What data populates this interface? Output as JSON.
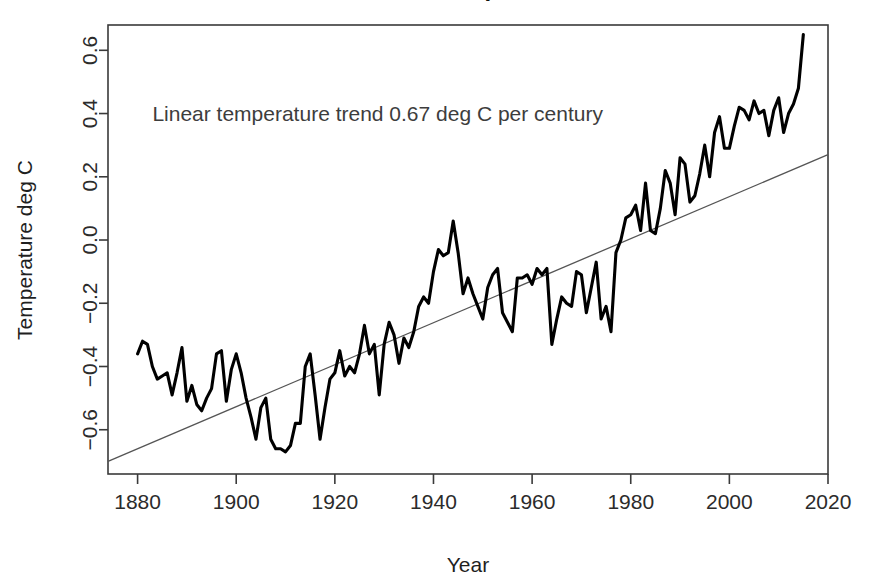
{
  "chart_data": {
    "type": "line",
    "title": "Global Land and Ocean Temperature Anomalies",
    "title_clipped": true,
    "xlabel": "Year",
    "ylabel": "Temperature deg C",
    "xlim": [
      1874,
      2020
    ],
    "ylim": [
      -0.74,
      0.68
    ],
    "grid": false,
    "legend": false,
    "xticks": [
      1880,
      1900,
      1920,
      1940,
      1960,
      1980,
      2000,
      2020
    ],
    "xtick_labels": [
      "1880",
      "1900",
      "1920",
      "1940",
      "1960",
      "1980",
      "2000",
      "2020"
    ],
    "yticks": [
      -0.6,
      -0.4,
      -0.2,
      0.0,
      0.2,
      0.4,
      0.6
    ],
    "ytick_labels": [
      "-0.6",
      "-0.4",
      "-0.2",
      "0.0",
      "0.2",
      "0.4",
      "0.6"
    ],
    "annotations": [
      {
        "text": "Linear temperature trend 0.67 deg C per century",
        "x": 1883,
        "y": 0.4
      }
    ],
    "series": [
      {
        "name": "Temperature anomaly",
        "color": "#000000",
        "x": [
          1880,
          1881,
          1882,
          1883,
          1884,
          1885,
          1886,
          1887,
          1888,
          1889,
          1890,
          1891,
          1892,
          1893,
          1894,
          1895,
          1896,
          1897,
          1898,
          1899,
          1900,
          1901,
          1902,
          1903,
          1904,
          1905,
          1906,
          1907,
          1908,
          1909,
          1910,
          1911,
          1912,
          1913,
          1914,
          1915,
          1916,
          1917,
          1918,
          1919,
          1920,
          1921,
          1922,
          1923,
          1924,
          1925,
          1926,
          1927,
          1928,
          1929,
          1930,
          1931,
          1932,
          1933,
          1934,
          1935,
          1936,
          1937,
          1938,
          1939,
          1940,
          1941,
          1942,
          1943,
          1944,
          1945,
          1946,
          1947,
          1948,
          1949,
          1950,
          1951,
          1952,
          1953,
          1954,
          1955,
          1956,
          1957,
          1958,
          1959,
          1960,
          1961,
          1962,
          1963,
          1964,
          1965,
          1966,
          1967,
          1968,
          1969,
          1970,
          1971,
          1972,
          1973,
          1974,
          1975,
          1976,
          1977,
          1978,
          1979,
          1980,
          1981,
          1982,
          1983,
          1984,
          1985,
          1986,
          1987,
          1988,
          1989,
          1990,
          1991,
          1992,
          1993,
          1994,
          1995,
          1996,
          1997,
          1998,
          1999,
          2000,
          2001,
          2002,
          2003,
          2004,
          2005,
          2006,
          2007,
          2008,
          2009,
          2010,
          2011,
          2012,
          2013,
          2014,
          2015
        ],
        "values": [
          -0.36,
          -0.32,
          -0.33,
          -0.4,
          -0.44,
          -0.43,
          -0.42,
          -0.49,
          -0.42,
          -0.34,
          -0.51,
          -0.46,
          -0.52,
          -0.54,
          -0.5,
          -0.47,
          -0.36,
          -0.35,
          -0.51,
          -0.41,
          -0.36,
          -0.42,
          -0.5,
          -0.56,
          -0.63,
          -0.53,
          -0.5,
          -0.63,
          -0.66,
          -0.66,
          -0.67,
          -0.65,
          -0.58,
          -0.58,
          -0.4,
          -0.36,
          -0.49,
          -0.63,
          -0.53,
          -0.44,
          -0.42,
          -0.35,
          -0.43,
          -0.4,
          -0.42,
          -0.36,
          -0.27,
          -0.36,
          -0.33,
          -0.49,
          -0.33,
          -0.26,
          -0.3,
          -0.39,
          -0.31,
          -0.34,
          -0.29,
          -0.21,
          -0.18,
          -0.2,
          -0.1,
          -0.03,
          -0.05,
          -0.04,
          0.06,
          -0.04,
          -0.17,
          -0.12,
          -0.17,
          -0.21,
          -0.25,
          -0.15,
          -0.11,
          -0.09,
          -0.23,
          -0.26,
          -0.29,
          -0.12,
          -0.12,
          -0.11,
          -0.14,
          -0.09,
          -0.11,
          -0.09,
          -0.33,
          -0.25,
          -0.18,
          -0.2,
          -0.21,
          -0.1,
          -0.11,
          -0.23,
          -0.15,
          -0.07,
          -0.25,
          -0.21,
          -0.29,
          -0.04,
          0.0,
          0.07,
          0.08,
          0.11,
          0.03,
          0.18,
          0.03,
          0.02,
          0.1,
          0.22,
          0.18,
          0.08,
          0.26,
          0.24,
          0.12,
          0.14,
          0.21,
          0.3,
          0.2,
          0.34,
          0.39,
          0.29,
          0.29,
          0.36,
          0.42,
          0.41,
          0.38,
          0.44,
          0.4,
          0.41,
          0.33,
          0.41,
          0.45,
          0.34,
          0.4,
          0.43,
          0.48,
          0.65
        ]
      }
    ],
    "trend": {
      "name": "Linear temperature trend",
      "color": "#555555",
      "slope_deg_c_per_century": 0.67,
      "x": [
        1874,
        2020
      ],
      "values": [
        -0.7,
        0.27
      ]
    }
  },
  "axes": {
    "y_title": "Temperature deg C",
    "x_title": "Year"
  }
}
